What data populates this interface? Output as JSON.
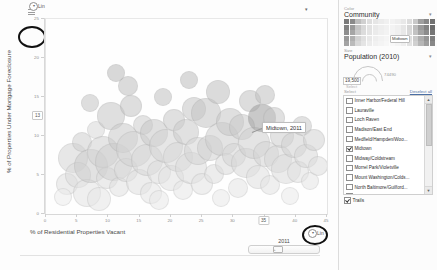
{
  "chart_data": {
    "type": "scatter",
    "title": "",
    "xlabel": "% of Residential Properties Vacant",
    "ylabel": "% of Properties Under Mortgage Foreclosure",
    "xlim": [
      0,
      45
    ],
    "ylim": [
      0,
      26
    ],
    "grid": false,
    "legend_position": "right-panel",
    "xticks": [
      "0",
      "5",
      "10",
      "15",
      "20",
      "25",
      "30",
      "35",
      "40",
      "45"
    ],
    "yticks": [
      "25",
      "20",
      "15",
      "10",
      "5",
      "0"
    ],
    "highlighted_x": "35",
    "highlighted_y": "13",
    "annotation": "Midtown, 2011",
    "size_encoding": "Population (2010)",
    "color_encoding": "Community",
    "points": [
      {
        "x": 3.2,
        "y": 4.1,
        "r": 10,
        "c": "#e0e0e0"
      },
      {
        "x": 4.1,
        "y": 7.6,
        "r": 14,
        "c": "#d6d6d6"
      },
      {
        "x": 5.0,
        "y": 5.3,
        "r": 12,
        "c": "#dcdcdc"
      },
      {
        "x": 5.6,
        "y": 9.8,
        "r": 9,
        "c": "#cfcfcf"
      },
      {
        "x": 6.4,
        "y": 3.0,
        "r": 13,
        "c": "#e3e3e3"
      },
      {
        "x": 7.1,
        "y": 6.5,
        "r": 16,
        "c": "#cccccc"
      },
      {
        "x": 7.8,
        "y": 11.4,
        "r": 8,
        "c": "#d9d9d9"
      },
      {
        "x": 8.3,
        "y": 2.2,
        "r": 11,
        "c": "#e6e6e6"
      },
      {
        "x": 8.9,
        "y": 8.4,
        "r": 15,
        "c": "#d2d2d2"
      },
      {
        "x": 9.6,
        "y": 5.0,
        "r": 10,
        "c": "#dedede"
      },
      {
        "x": 10.2,
        "y": 13.2,
        "r": 13,
        "c": "#c7c7c7"
      },
      {
        "x": 10.8,
        "y": 7.1,
        "r": 18,
        "c": "#d0d0d0"
      },
      {
        "x": 11.5,
        "y": 3.8,
        "r": 9,
        "c": "#e1e1e1"
      },
      {
        "x": 12.1,
        "y": 10.3,
        "r": 14,
        "c": "#cacaca"
      },
      {
        "x": 12.7,
        "y": 6.0,
        "r": 11,
        "c": "#dadada"
      },
      {
        "x": 13.4,
        "y": 14.6,
        "r": 10,
        "c": "#c4c4c4"
      },
      {
        "x": 14.0,
        "y": 8.8,
        "r": 17,
        "c": "#d4d4d4"
      },
      {
        "x": 14.7,
        "y": 4.4,
        "r": 12,
        "c": "#e0e0e0"
      },
      {
        "x": 15.3,
        "y": 12.0,
        "r": 9,
        "c": "#cdcdcd"
      },
      {
        "x": 16.0,
        "y": 7.3,
        "r": 15,
        "c": "#d7d7d7"
      },
      {
        "x": 16.6,
        "y": 2.9,
        "r": 10,
        "c": "#e5e5e5"
      },
      {
        "x": 17.2,
        "y": 10.9,
        "r": 13,
        "c": "#c9c9c9"
      },
      {
        "x": 17.9,
        "y": 5.8,
        "r": 11,
        "c": "#dddddd"
      },
      {
        "x": 18.5,
        "y": 15.8,
        "r": 8,
        "c": "#c2c2c2"
      },
      {
        "x": 19.1,
        "y": 9.2,
        "r": 16,
        "c": "#d3d3d3"
      },
      {
        "x": 19.8,
        "y": 4.9,
        "r": 12,
        "c": "#e2e2e2"
      },
      {
        "x": 20.4,
        "y": 12.7,
        "r": 10,
        "c": "#c8c8c8"
      },
      {
        "x": 21.0,
        "y": 7.8,
        "r": 14,
        "c": "#d8d8d8"
      },
      {
        "x": 21.7,
        "y": 3.4,
        "r": 9,
        "c": "#e7e7e7"
      },
      {
        "x": 22.3,
        "y": 11.1,
        "r": 12,
        "c": "#cbcbcb"
      },
      {
        "x": 23.0,
        "y": 6.3,
        "r": 15,
        "c": "#dcdcdc"
      },
      {
        "x": 23.6,
        "y": 14.1,
        "r": 11,
        "c": "#c6c6c6"
      },
      {
        "x": 24.2,
        "y": 8.6,
        "r": 13,
        "c": "#d5d5d5"
      },
      {
        "x": 24.9,
        "y": 4.2,
        "r": 10,
        "c": "#e3e3e3"
      },
      {
        "x": 25.5,
        "y": 13.6,
        "r": 14,
        "c": "#c5c5c5"
      },
      {
        "x": 26.1,
        "y": 9.0,
        "r": 12,
        "c": "#d1d1d1"
      },
      {
        "x": 26.8,
        "y": 5.5,
        "r": 9,
        "c": "#dfdfdf"
      },
      {
        "x": 27.4,
        "y": 16.4,
        "r": 11,
        "c": "#c0c0c0"
      },
      {
        "x": 28.1,
        "y": 10.1,
        "r": 16,
        "c": "#cecece"
      },
      {
        "x": 28.7,
        "y": 6.8,
        "r": 10,
        "c": "#dbdbdb"
      },
      {
        "x": 29.3,
        "y": 12.4,
        "r": 13,
        "c": "#c7c7c7"
      },
      {
        "x": 30.0,
        "y": 8.0,
        "r": 11,
        "c": "#d6d6d6"
      },
      {
        "x": 30.6,
        "y": 3.6,
        "r": 9,
        "c": "#e6e6e6"
      },
      {
        "x": 31.2,
        "y": 11.7,
        "r": 12,
        "c": "#cacaca"
      },
      {
        "x": 31.9,
        "y": 7.0,
        "r": 14,
        "c": "#d9d9d9"
      },
      {
        "x": 32.5,
        "y": 15.2,
        "r": 10,
        "c": "#c3c3c3"
      },
      {
        "x": 33.2,
        "y": 9.6,
        "r": 15,
        "c": "#d0d0d0"
      },
      {
        "x": 33.8,
        "y": 5.1,
        "r": 11,
        "c": "#e0e0e0"
      },
      {
        "x": 34.4,
        "y": 13.0,
        "r": 13,
        "c": "#9e9e9e"
      },
      {
        "x": 35.1,
        "y": 8.2,
        "r": 12,
        "c": "#d4d4d4"
      },
      {
        "x": 35.7,
        "y": 4.0,
        "r": 9,
        "c": "#e4e4e4"
      },
      {
        "x": 36.3,
        "y": 12.9,
        "r": 10,
        "c": "#c9c9c9"
      },
      {
        "x": 37.0,
        "y": 7.5,
        "r": 13,
        "c": "#d7d7d7"
      },
      {
        "x": 37.6,
        "y": 10.6,
        "r": 11,
        "c": "#cdcdcd"
      },
      {
        "x": 38.3,
        "y": 6.1,
        "r": 14,
        "c": "#dddddd"
      },
      {
        "x": 38.9,
        "y": 2.6,
        "r": 8,
        "c": "#ebebeb"
      },
      {
        "x": 39.5,
        "y": 9.4,
        "r": 12,
        "c": "#d2d2d2"
      },
      {
        "x": 40.2,
        "y": 5.7,
        "r": 10,
        "c": "#e1e1e1"
      },
      {
        "x": 40.8,
        "y": 11.9,
        "r": 9,
        "c": "#cbcbcb"
      },
      {
        "x": 41.5,
        "y": 7.9,
        "r": 11,
        "c": "#d8d8d8"
      },
      {
        "x": 42.1,
        "y": 4.5,
        "r": 8,
        "c": "#e5e5e5"
      },
      {
        "x": 42.7,
        "y": 10.0,
        "r": 10,
        "c": "#d3d3d3"
      },
      {
        "x": 43.4,
        "y": 6.6,
        "r": 9,
        "c": "#dedede"
      },
      {
        "x": 2.6,
        "y": 2.4,
        "r": 8,
        "c": "#ececec"
      },
      {
        "x": 13.0,
        "y": 17.2,
        "r": 9,
        "c": "#bfbfbf"
      },
      {
        "x": 22.8,
        "y": 18.0,
        "r": 8,
        "c": "#bdbdbd"
      },
      {
        "x": 6.9,
        "y": 14.9,
        "r": 8,
        "c": "#c5c5c5"
      },
      {
        "x": 18.0,
        "y": 2.0,
        "r": 9,
        "c": "#eaeaea"
      },
      {
        "x": 27.9,
        "y": 2.3,
        "r": 8,
        "c": "#e9e9e9"
      },
      {
        "x": 34.9,
        "y": 16.0,
        "r": 9,
        "c": "#c1c1c1"
      },
      {
        "x": 11.0,
        "y": 19.0,
        "r": 8,
        "c": "#bababa"
      }
    ]
  },
  "axis_controls": {
    "y_scale_label": "Lin",
    "x_scale_label": "Lin",
    "y_scale_glyph": "▾",
    "x_scale_glyph": "▾",
    "settings_glyph": "▾"
  },
  "timeline": {
    "year": "2011",
    "thumb_glyph": "◦"
  },
  "panel": {
    "color_section_label": "Color",
    "color_field_value": "Community",
    "color_field_caret": "▾",
    "color_legend_highlight": "Midtown",
    "size_section_label": "Size",
    "size_field_value": "Population (2010)",
    "size_field_caret": "▾",
    "size_min_value": "19,500",
    "size_max_value": "74490",
    "size_min_caption": "Select",
    "select_label": "Select",
    "deselect_link": "Deselect all",
    "scroll_up_glyph": "▲",
    "scroll_down_glyph": "▼",
    "trails_label": "Trails",
    "trails_checked": true,
    "items": [
      {
        "label": "Inner Harbor/Federal Hill",
        "checked": false
      },
      {
        "label": "Lauraville",
        "checked": false
      },
      {
        "label": "Loch Raven",
        "checked": false
      },
      {
        "label": "Madison/East End",
        "checked": false
      },
      {
        "label": "Medfield/Hampden/Woo...",
        "checked": false
      },
      {
        "label": "Midtown",
        "checked": true
      },
      {
        "label": "Midway/Coldstream",
        "checked": false
      },
      {
        "label": "Morrel Park/Violetville",
        "checked": false
      },
      {
        "label": "Mount Washington/Colds...",
        "checked": false
      },
      {
        "label": "North Baltimore/Guilford...",
        "checked": false
      },
      {
        "label": "Northwood",
        "checked": false
      },
      {
        "label": "Oldtown/Middle East",
        "checked": false
      },
      {
        "label": "Orangeville/East Highlan...",
        "checked": false
      },
      {
        "label": "Patterson Park North &...",
        "checked": false
      }
    ]
  },
  "color_legend_swatches": [
    "#7a7a7a",
    "#8a8a8a",
    "#bdbdbd",
    "#d0d0d0",
    "#dedede",
    "#e6e6e6",
    "#ececec",
    "#f0f0f0",
    "#f2f2f2",
    "#eeeeee",
    "#e8e8e8",
    "#dcdcdc",
    "#c8c8c8",
    "#9f9f9f",
    "#878787",
    "#707070",
    "#828282",
    "#9a9a9a",
    "#c4c4c4",
    "#d8d8d8",
    "#e2e2e2",
    "#e9e9e9",
    "#eeeeee",
    "#f1f1f1",
    "#f3f3f3",
    "#efefef",
    "#e6e6e6",
    "#d6d6d6",
    "#bcbcbc",
    "#9a9a9a",
    "#828282",
    "#6b6b6b",
    "#8e8e8e",
    "#a6a6a6",
    "#cacaca",
    "#dcdcdc",
    "#e4e4e4",
    "#ebebeb",
    "#f0f0f0",
    "#f3f3f3",
    "#f4f4f4",
    "#f0f0f0",
    "#e8e8e8",
    "#d9d9d9",
    "#c2c2c2",
    "#a4a4a4",
    "#8c8c8c",
    "#757575",
    "#999999",
    "#b0b0b0",
    "#d2d2d2",
    "#e0e0e0",
    "#e8e8e8",
    "#eeeeee",
    "#f2f2f2",
    "#f5f5f5",
    "#f6f6f6",
    "#f2f2f2",
    "#ebebeb",
    "#dedede",
    "#cacaca",
    "#aeaeae",
    "#969696",
    "#7f7f7f",
    "#a3a3a3",
    "#bababa",
    "#d8d8d8",
    "#e4e4e4",
    "#ececec",
    "#f1f1f1",
    "#f4f4f4",
    "#f7f7f7",
    "#f8f8f8",
    "#f4f4f4",
    "#eeeeee",
    "#e2e2e2",
    "#d0d0d0",
    "#b6b6b6",
    "#9e9e9e",
    "#888888"
  ]
}
